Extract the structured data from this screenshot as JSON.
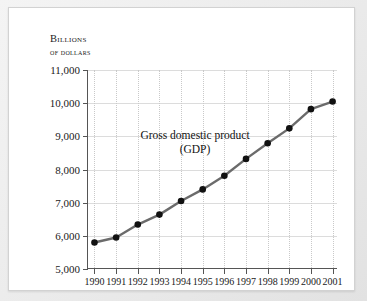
{
  "axis_label": {
    "line1": "Billions",
    "line2": "of dollars"
  },
  "annotation": {
    "line1": "Gross domestic product",
    "line2": "(GDP)"
  },
  "chart_data": {
    "type": "line",
    "title": "Gross domestic product (GDP)",
    "xlabel": "",
    "ylabel": "Billions of dollars",
    "ylim": [
      5000,
      11000
    ],
    "ytick_step": 1000,
    "ytick_labels": [
      "11,000",
      "10,000",
      "9,000",
      "8,000",
      "7,000",
      "6,000",
      "5,000"
    ],
    "ytick_values": [
      11000,
      10000,
      9000,
      8000,
      7000,
      6000,
      5000
    ],
    "categories": [
      "1990",
      "1991",
      "1992",
      "1993",
      "1994",
      "1995",
      "1996",
      "1997",
      "1998",
      "1999",
      "2000",
      "2001"
    ],
    "x": [
      1990,
      1991,
      1992,
      1993,
      1994,
      1995,
      1996,
      1997,
      1998,
      1999,
      2000,
      2001
    ],
    "values": [
      5800,
      5950,
      6340,
      6640,
      7050,
      7400,
      7810,
      8320,
      8790,
      9240,
      9820,
      10050
    ],
    "grid": {
      "horizontal": true,
      "vertical": true,
      "vertical_style": "dotted"
    },
    "legend": "none",
    "marker": "circle",
    "line_color": "#6b6b6b",
    "marker_color": "#111111"
  },
  "colors": {
    "card_background": "#ffffff",
    "page_background": "#e9e9e9",
    "axis": "#555555",
    "gridline": "#dcdcdc",
    "text": "#1a1a1a"
  }
}
